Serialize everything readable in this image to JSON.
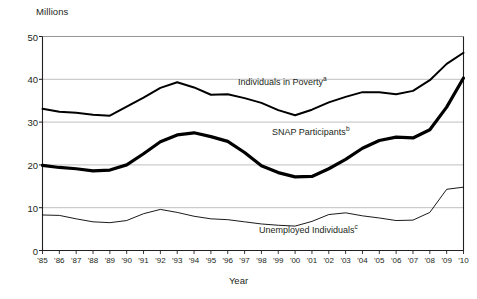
{
  "chart_data": {
    "type": "line",
    "title": "",
    "xlabel": "Year",
    "ylabel": "Millions",
    "ylim": [
      0,
      50
    ],
    "yticks": [
      0,
      10,
      20,
      30,
      40,
      50
    ],
    "grid": "horizontal",
    "legend_position": "inline-annotations",
    "x": [
      "'85",
      "'86",
      "'87",
      "'88",
      "'89",
      "'90",
      "'91",
      "'92",
      "'93",
      "'94",
      "'95",
      "'96",
      "'97",
      "'98",
      "'99",
      "'00",
      "'01",
      "'02",
      "'03",
      "'04",
      "'05",
      "'06",
      "'07",
      "'08",
      "'09",
      "'10"
    ],
    "x_full_years": [
      1985,
      1986,
      1987,
      1988,
      1989,
      1990,
      1991,
      1992,
      1993,
      1994,
      1995,
      1996,
      1997,
      1998,
      1999,
      2000,
      2001,
      2002,
      2003,
      2004,
      2005,
      2006,
      2007,
      2008,
      2009,
      2010
    ],
    "series": [
      {
        "name": "Individuals in Poverty",
        "footnote": "a",
        "stroke": "#000000",
        "stroke_width": 2.0,
        "values": [
          33.1,
          32.4,
          32.2,
          31.7,
          31.5,
          33.6,
          35.7,
          38.0,
          39.3,
          38.1,
          36.4,
          36.5,
          35.6,
          34.5,
          32.8,
          31.6,
          32.9,
          34.6,
          35.9,
          37.0,
          37.0,
          36.5,
          37.3,
          39.8,
          43.6,
          46.2
        ],
        "units": "Millions"
      },
      {
        "name": "SNAP Participants",
        "footnote": "b",
        "stroke": "#000000",
        "stroke_width": 3.2,
        "values": [
          19.9,
          19.4,
          19.1,
          18.6,
          18.8,
          20.0,
          22.6,
          25.4,
          27.0,
          27.5,
          26.6,
          25.5,
          22.9,
          19.8,
          18.2,
          17.2,
          17.3,
          19.1,
          21.3,
          23.9,
          25.7,
          26.5,
          26.3,
          28.2,
          33.5,
          40.3
        ],
        "units": "Millions"
      },
      {
        "name": "Unemployed Individuals",
        "footnote": "c",
        "stroke": "#000000",
        "stroke_width": 0.9,
        "values": [
          8.3,
          8.2,
          7.4,
          6.7,
          6.5,
          7.0,
          8.6,
          9.6,
          8.9,
          8.0,
          7.4,
          7.2,
          6.7,
          6.2,
          5.9,
          5.7,
          6.8,
          8.4,
          8.8,
          8.1,
          7.6,
          7.0,
          7.1,
          8.9,
          14.3,
          14.8
        ],
        "units": "Millions"
      }
    ]
  },
  "annotations": {
    "poverty_label": "Individuals in Poverty",
    "poverty_sup": "a",
    "snap_label": "SNAP Participants",
    "snap_sup": "b",
    "unemployed_label": "Unemployed Individuals",
    "unemployed_sup": "c"
  },
  "axes": {
    "y_unit_caption": "Millions",
    "x_title": "Year"
  },
  "colors": {
    "plot_frame": "#231f20",
    "gridline": "#b9b9b9",
    "series_stroke": "#000000",
    "background": "#ffffff",
    "text": "#231f20"
  }
}
